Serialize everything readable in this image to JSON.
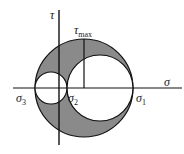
{
  "diagram": {
    "axes": {
      "horizontal_label": "σ",
      "vertical_label": "τ"
    },
    "labels": {
      "tau_max": "τ",
      "tau_max_sub": "max",
      "sigma1": "σ",
      "sigma1_sub": "1",
      "sigma2": "σ",
      "sigma2_sub": "2",
      "sigma3": "σ",
      "sigma3_sub": "3"
    },
    "circles": [
      {
        "name": "outer",
        "spans": "σ3 to σ1",
        "filled": true
      },
      {
        "name": "small",
        "spans": "σ3 to σ2",
        "filled": false
      },
      {
        "name": "medium",
        "spans": "σ2 to σ1",
        "filled": false
      }
    ],
    "colors": {
      "fill": "#8a8a8a",
      "stroke": "#111111",
      "background": "#ffffff"
    }
  }
}
